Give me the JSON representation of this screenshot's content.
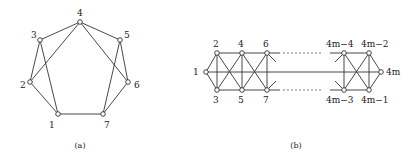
{
  "figure_a": {
    "caption": "(a)",
    "nodes": [
      {
        "id": "1",
        "label": "1",
        "x": 58,
        "y": 114,
        "lx": 49,
        "ly": 128
      },
      {
        "id": "2",
        "label": "2",
        "x": 30,
        "y": 82,
        "lx": 20,
        "ly": 88
      },
      {
        "id": "3",
        "label": "3",
        "x": 40,
        "y": 40,
        "lx": 31,
        "ly": 38
      },
      {
        "id": "4",
        "label": "4",
        "x": 80,
        "y": 22,
        "lx": 77,
        "ly": 16
      },
      {
        "id": "5",
        "label": "5",
        "x": 120,
        "y": 40,
        "lx": 124,
        "ly": 38
      },
      {
        "id": "6",
        "label": "6",
        "x": 128,
        "y": 82,
        "lx": 134,
        "ly": 88
      },
      {
        "id": "7",
        "label": "7",
        "x": 103,
        "y": 114,
        "lx": 104,
        "ly": 128
      }
    ],
    "edges": [
      [
        "4",
        "3"
      ],
      [
        "4",
        "5"
      ],
      [
        "4",
        "2"
      ],
      [
        "4",
        "6"
      ],
      [
        "3",
        "2"
      ],
      [
        "3",
        "1"
      ],
      [
        "5",
        "6"
      ],
      [
        "5",
        "7"
      ],
      [
        "2",
        "1"
      ],
      [
        "6",
        "7"
      ],
      [
        "1",
        "7"
      ]
    ]
  },
  "figure_b": {
    "caption": "(b)",
    "nodes": [
      {
        "id": "1",
        "label": "1",
        "x": 206,
        "y": 72,
        "lx": 193,
        "ly": 75
      },
      {
        "id": "2",
        "label": "2",
        "x": 217,
        "y": 53,
        "lx": 213,
        "ly": 47
      },
      {
        "id": "3",
        "label": "3",
        "x": 217,
        "y": 90,
        "lx": 213,
        "ly": 103
      },
      {
        "id": "4",
        "label": "4",
        "x": 242,
        "y": 53,
        "lx": 238,
        "ly": 47
      },
      {
        "id": "5",
        "label": "5",
        "x": 242,
        "y": 90,
        "lx": 238,
        "ly": 103
      },
      {
        "id": "6",
        "label": "6",
        "x": 267,
        "y": 53,
        "lx": 263,
        "ly": 47
      },
      {
        "id": "7",
        "label": "7",
        "x": 267,
        "y": 90,
        "lx": 263,
        "ly": 103
      },
      {
        "id": "4m-4",
        "label": "4m−4",
        "x": 344,
        "y": 53,
        "lx": 326,
        "ly": 47
      },
      {
        "id": "4m-2",
        "label": "4m−2",
        "x": 369,
        "y": 53,
        "lx": 361,
        "ly": 47
      },
      {
        "id": "4m-3",
        "label": "4m−3",
        "x": 344,
        "y": 90,
        "lx": 326,
        "ly": 103
      },
      {
        "id": "4m-1",
        "label": "4m−1",
        "x": 369,
        "y": 90,
        "lx": 361,
        "ly": 103
      },
      {
        "id": "4m",
        "label": "4m",
        "x": 381,
        "y": 72,
        "lx": 386,
        "ly": 75
      }
    ],
    "edges": [
      [
        "1",
        "2"
      ],
      [
        "1",
        "3"
      ],
      [
        "2",
        "3"
      ],
      [
        "2",
        "4"
      ],
      [
        "3",
        "5"
      ],
      [
        "2",
        "5"
      ],
      [
        "3",
        "4"
      ],
      [
        "4",
        "5"
      ],
      [
        "4",
        "6"
      ],
      [
        "5",
        "7"
      ],
      [
        "4",
        "7"
      ],
      [
        "5",
        "6"
      ],
      [
        "6",
        "7"
      ],
      [
        "4m-4",
        "4m-2"
      ],
      [
        "4m-3",
        "4m-1"
      ],
      [
        "4m-4",
        "4m-1"
      ],
      [
        "4m-3",
        "4m-2"
      ],
      [
        "4m-4",
        "4m-3"
      ],
      [
        "4m-2",
        "4m-1"
      ],
      [
        "4m-2",
        "4m"
      ],
      [
        "4m-1",
        "4m"
      ]
    ],
    "middle_line": {
      "x1": 206,
      "y1": 72,
      "x2": 381,
      "y2": 72
    },
    "top_stub": {
      "x1": 267,
      "y1": 53,
      "x2": 280,
      "y2": 53
    },
    "bottom_stub": {
      "x1": 267,
      "y1": 90,
      "x2": 280,
      "y2": 90
    },
    "top_dashed": {
      "x1": 283,
      "y1": 53,
      "x2": 322,
      "y2": 53
    },
    "bottom_dashed": {
      "x1": 283,
      "y1": 90,
      "x2": 322,
      "y2": 90
    },
    "top_stub_right": {
      "x1": 330,
      "y1": 53,
      "x2": 344,
      "y2": 53
    },
    "bottom_stub_right": {
      "x1": 330,
      "y1": 90,
      "x2": 344,
      "y2": 90
    },
    "partial_edges": [
      {
        "x1": 267,
        "y1": 53,
        "x2": 276,
        "y2": 62
      },
      {
        "x1": 267,
        "y1": 90,
        "x2": 276,
        "y2": 81
      },
      {
        "x1": 344,
        "y1": 53,
        "x2": 335,
        "y2": 62
      },
      {
        "x1": 344,
        "y1": 90,
        "x2": 335,
        "y2": 81
      }
    ]
  },
  "captions": {
    "a": {
      "text": "(a)",
      "x": 80,
      "y": 148
    },
    "b": {
      "text": "(b)",
      "x": 296,
      "y": 148
    }
  }
}
